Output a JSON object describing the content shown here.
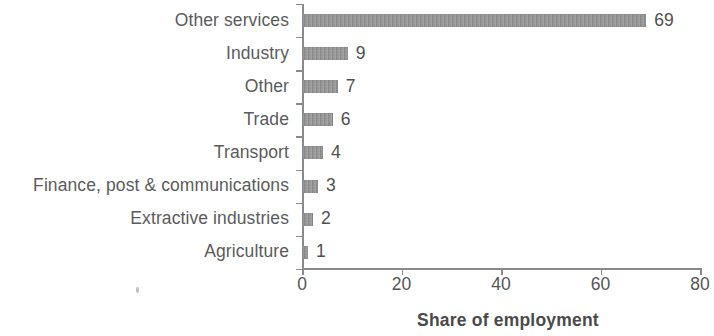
{
  "chart_data": {
    "type": "bar",
    "orientation": "horizontal",
    "title": "",
    "xlabel": "Share of employment",
    "ylabel": "",
    "xlim": [
      0,
      80
    ],
    "xticks": [
      0,
      20,
      40,
      60,
      80
    ],
    "xtick_labels": [
      "0",
      "20",
      "40",
      "60",
      "80"
    ],
    "grid": false,
    "legend": null,
    "bar_color": "#8d8d8d",
    "axis_color": "#8a8a8a",
    "label_color": "#5b5b5b",
    "background": "#ffffff",
    "categories": [
      "Other services",
      "Industry",
      "Other",
      "Trade",
      "Transport",
      "Finance, post & communications",
      "Extractive industries",
      "Agriculture"
    ],
    "values": [
      69,
      9,
      7,
      6,
      4,
      3,
      2,
      1
    ],
    "value_labels": [
      "69",
      "9",
      "7",
      "6",
      "4",
      "3",
      "2",
      "1"
    ]
  }
}
